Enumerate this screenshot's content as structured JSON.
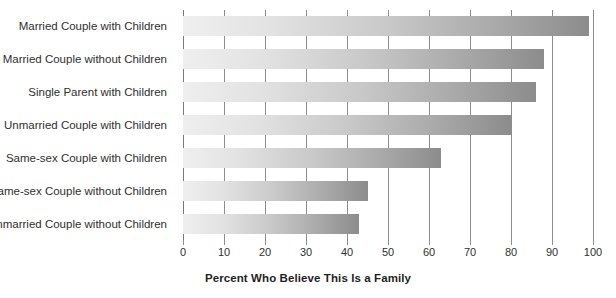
{
  "chart_data": {
    "type": "bar",
    "orientation": "horizontal",
    "title": "",
    "xlabel": "Percent Who Believe This Is a Family",
    "ylabel": "",
    "xlim": [
      0,
      100
    ],
    "xticks": [
      0,
      10,
      20,
      30,
      40,
      50,
      60,
      70,
      80,
      90,
      100
    ],
    "grid": true,
    "legend": false,
    "categories": [
      "Married Couple with Children",
      "Married Couple without Children",
      "Single Parent with Children",
      "Unmarried Couple with Children",
      "Same-sex Couple with Children",
      "Same-sex Couple without Children",
      "Unmarried Couple without Children"
    ],
    "values": [
      99,
      88,
      86,
      80,
      63,
      45,
      43
    ],
    "bar_gradient": {
      "from": "#efefef",
      "to": "#8c8c8c"
    },
    "colors": {
      "gridline": "#8d8d8d",
      "text": "#2f2f2f",
      "axis_title": "#1f1f1f",
      "background": "#ffffff"
    }
  }
}
